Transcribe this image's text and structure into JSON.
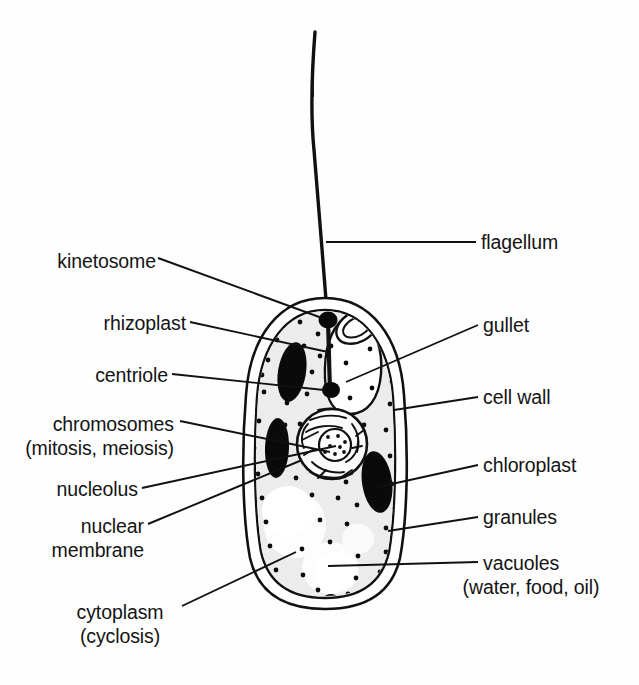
{
  "diagram": {
    "organism": "euglena-like flagellate cell",
    "style": "black-and-white line drawing with leader lines",
    "background_color": "#fefefe",
    "ink_color": "#111111",
    "cytoplasm_fill": "#ececec",
    "organelle_fill": "#0a0a0a",
    "vacuole_fill": "#ffffff"
  },
  "labels": {
    "left": [
      {
        "id": "kinetosome",
        "text": "kinetosome",
        "text2": ""
      },
      {
        "id": "rhizoplast",
        "text": "rhizoplast",
        "text2": ""
      },
      {
        "id": "centriole",
        "text": "centriole",
        "text2": ""
      },
      {
        "id": "chromosomes",
        "text": "chromosomes",
        "text2": "(mitosis, meiosis)"
      },
      {
        "id": "nucleolus",
        "text": "nucleolus",
        "text2": ""
      },
      {
        "id": "nuclear-membrane",
        "text": "nuclear",
        "text2": "membrane"
      },
      {
        "id": "cytoplasm",
        "text": "cytoplasm",
        "text2": "(cyclosis)"
      }
    ],
    "right": [
      {
        "id": "flagellum",
        "text": "flagellum",
        "text2": ""
      },
      {
        "id": "gullet",
        "text": "gullet",
        "text2": ""
      },
      {
        "id": "cell-wall",
        "text": "cell wall",
        "text2": ""
      },
      {
        "id": "chloroplast",
        "text": "chloroplast",
        "text2": ""
      },
      {
        "id": "granules",
        "text": "granules",
        "text2": ""
      },
      {
        "id": "vacuoles",
        "text": "vacuoles",
        "text2": "(water, food, oil)"
      }
    ]
  },
  "structures": [
    {
      "name": "flagellum",
      "description": "long tapering whip-like filament rising from top of cell"
    },
    {
      "name": "kinetosome",
      "description": "black basal body dot at flagellum base inside cell"
    },
    {
      "name": "rhizoplast",
      "description": "vertical dark strand from kinetosome down to centriole"
    },
    {
      "name": "centriole",
      "description": "black dot at lower end of rhizoplast"
    },
    {
      "name": "gullet",
      "description": "oval opening with tear-drop reservoir chamber at upper right"
    },
    {
      "name": "cell-wall",
      "description": "double outline pellicle enclosing the cell"
    },
    {
      "name": "chloroplasts",
      "description": "four dark elongated ellipses in cytoplasm"
    },
    {
      "name": "granules",
      "description": "small black dots scattered through cytoplasm"
    },
    {
      "name": "vacuoles",
      "description": "three pale rounded clear areas in lower cell"
    },
    {
      "name": "nucleus",
      "description": "central circle with chromatin threads and dotted nucleolus"
    }
  ]
}
